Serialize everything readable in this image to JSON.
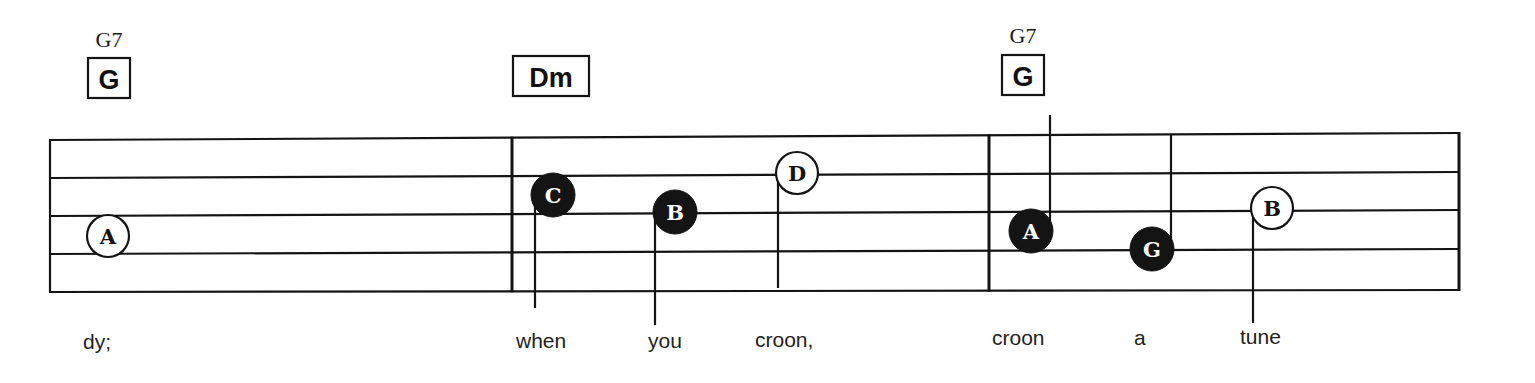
{
  "colors": {
    "ink": "#141414",
    "paper": "#ffffff"
  },
  "staff": {
    "left_x": 50,
    "right_x": 1459,
    "lines_left_y": [
      140,
      178,
      216,
      254,
      292
    ],
    "lines_right_y": [
      133,
      172,
      210,
      249,
      290
    ],
    "barlines_x": [
      50,
      512,
      989,
      1459
    ]
  },
  "chords": [
    {
      "label_small": "G7",
      "box_text": "G",
      "x": 88,
      "label_y": 47,
      "box_y": 58,
      "box_w": 42,
      "box_h": 40
    },
    {
      "label_small": "",
      "box_text": "Dm",
      "x": 513,
      "label_y": 0,
      "box_y": 56,
      "box_w": 76,
      "box_h": 40
    },
    {
      "label_small": "G7",
      "box_text": "G",
      "x": 1002,
      "label_y": 43,
      "box_y": 55,
      "box_w": 42,
      "box_h": 40
    }
  ],
  "notes": [
    {
      "letter": "A",
      "filled": false,
      "cx": 108,
      "cy": 236,
      "stem": "none"
    },
    {
      "letter": "C",
      "filled": true,
      "cx": 553,
      "cy": 195,
      "stem": "down",
      "stem_x": 535,
      "stem_end": 308
    },
    {
      "letter": "B",
      "filled": true,
      "cx": 675,
      "cy": 212,
      "stem": "down",
      "stem_x": 655,
      "stem_end": 325
    },
    {
      "letter": "D",
      "filled": false,
      "cx": 797,
      "cy": 173,
      "stem": "down",
      "stem_x": 778,
      "stem_end": 288
    },
    {
      "letter": "A",
      "filled": true,
      "cx": 1031,
      "cy": 231,
      "stem": "up",
      "stem_x": 1050,
      "stem_end": 115
    },
    {
      "letter": "G",
      "filled": true,
      "cx": 1152,
      "cy": 249,
      "stem": "up",
      "stem_x": 1171,
      "stem_end": 135
    },
    {
      "letter": "B",
      "filled": false,
      "cx": 1272,
      "cy": 208,
      "stem": "down",
      "stem_x": 1253,
      "stem_end": 323
    }
  ],
  "lyrics": [
    {
      "text": "dy;",
      "x": 83,
      "y": 349
    },
    {
      "text": "when",
      "x": 516,
      "y": 348
    },
    {
      "text": "you",
      "x": 648,
      "y": 348
    },
    {
      "text": "croon,",
      "x": 755,
      "y": 347
    },
    {
      "text": "croon",
      "x": 992,
      "y": 345
    },
    {
      "text": "a",
      "x": 1134,
      "y": 345
    },
    {
      "text": "tune",
      "x": 1240,
      "y": 344
    }
  ]
}
